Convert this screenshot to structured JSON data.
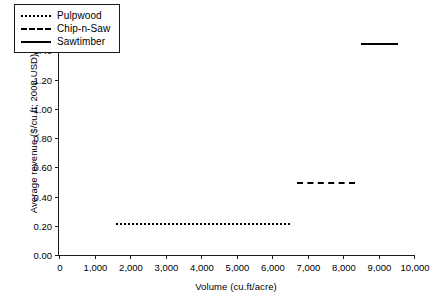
{
  "chart_data": {
    "type": "line",
    "title": "",
    "xlabel": "Volume (cu.ft/acre)",
    "ylabel": "Average revenue ($/cu.ft; 2008 USD)",
    "xlim": [
      0,
      10000
    ],
    "ylim": [
      0.0,
      1.6
    ],
    "xticks": [
      0,
      1000,
      2000,
      3000,
      4000,
      5000,
      6000,
      7000,
      8000,
      9000,
      10000
    ],
    "xtick_labels": [
      "0",
      "1,000",
      "2,000",
      "3,000",
      "4,000",
      "5,000",
      "6,000",
      "7,000",
      "8,000",
      "9,000",
      "10,000"
    ],
    "yticks": [
      0.0,
      0.2,
      0.4,
      0.6,
      0.8,
      1.0,
      1.2,
      1.4,
      1.6
    ],
    "ytick_labels": [
      "0.00",
      "0.20",
      "0.40",
      "0.60",
      "0.80",
      "1.00",
      "1.20",
      "1.40",
      "1.60"
    ],
    "grid": false,
    "legend_position": "top-left",
    "series": [
      {
        "name": "Pulpwood",
        "style": "dotted",
        "color": "#000000",
        "x_start": 1600,
        "x_end": 6500,
        "value": 0.22,
        "points": [
          [
            1600,
            0.22
          ],
          [
            6500,
            0.22
          ]
        ]
      },
      {
        "name": "Chip-n-Saw",
        "style": "dashed",
        "color": "#000000",
        "x_start": 6700,
        "x_end": 8350,
        "value": 0.5,
        "points": [
          [
            6700,
            0.5
          ],
          [
            8350,
            0.5
          ]
        ]
      },
      {
        "name": "Sawtimber",
        "style": "solid",
        "color": "#000000",
        "x_start": 8500,
        "x_end": 9550,
        "value": 1.45,
        "points": [
          [
            8500,
            1.45
          ],
          [
            9550,
            1.45
          ]
        ]
      }
    ]
  },
  "legend": {
    "items": [
      {
        "label": "Pulpwood",
        "style": "dotted"
      },
      {
        "label": "Chip-n-Saw",
        "style": "dashed"
      },
      {
        "label": "Sawtimber",
        "style": "solid"
      }
    ]
  }
}
